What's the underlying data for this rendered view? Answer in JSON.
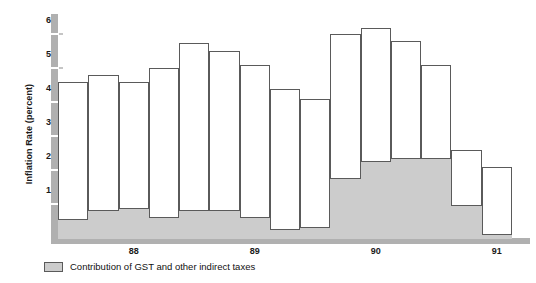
{
  "chart_data": {
    "type": "bar",
    "title": "",
    "subtitle": "",
    "xlabel": "",
    "ylabel": "Inflation Rate (percent)",
    "ylim": [
      0,
      6.6
    ],
    "yticks": [
      1,
      2,
      3,
      4,
      5,
      6
    ],
    "ytick_labels": [
      "1",
      "2",
      "3",
      "4",
      "5",
      "6"
    ],
    "grid": false,
    "legend_position": "bottom-left",
    "stacked": true,
    "x_axis_labels": [
      "88",
      "89",
      "90",
      "91",
      "92"
    ],
    "x_axis_label_positions": [
      2.5,
      6.5,
      10.5,
      14.5,
      17.2
    ],
    "categories": [
      "87Q4",
      "88Q1",
      "88Q2",
      "88Q3",
      "88Q4",
      "89Q1",
      "89Q2",
      "89Q3",
      "89Q4",
      "90Q1",
      "90Q2",
      "90Q3",
      "90Q4",
      "91Q1",
      "91Q2",
      "91Q3",
      "91Q4"
    ],
    "series": [
      {
        "name": "Contribution of GST and other indirect taxes",
        "color": "#cccccc",
        "values": [
          0.6,
          0.85,
          0.9,
          0.65,
          0.85,
          0.85,
          0.65,
          0.3,
          0.35,
          1.8,
          2.3,
          2.4,
          2.4,
          1.0,
          0.15,
          0.0,
          0.0
        ]
      },
      {
        "name": "Other inflation",
        "color": "#ffffff",
        "values": [
          4.0,
          3.95,
          3.7,
          4.35,
          4.9,
          4.65,
          4.45,
          4.1,
          3.75,
          4.2,
          3.9,
          3.4,
          2.7,
          1.6,
          1.95,
          0.0,
          0.0
        ]
      }
    ],
    "totals": [
      4.6,
      4.8,
      4.6,
      5.0,
      5.75,
      5.5,
      5.1,
      4.4,
      4.1,
      6.0,
      6.2,
      5.8,
      5.1,
      2.6,
      2.1,
      0.0,
      0.0
    ],
    "bar_count": 15,
    "bars": [
      {
        "label": "87Q4",
        "total": 4.6,
        "gst": 0.6,
        "x": 0,
        "w": 1
      },
      {
        "label": "88Q1",
        "total": 4.8,
        "gst": 0.85,
        "x": 1,
        "w": 1
      },
      {
        "label": "88Q2",
        "total": 4.6,
        "gst": 0.9,
        "x": 2,
        "w": 1
      },
      {
        "label": "88Q3",
        "total": 5.0,
        "gst": 0.65,
        "x": 3,
        "w": 1
      },
      {
        "label": "88Q4",
        "total": 5.75,
        "gst": 0.85,
        "x": 4,
        "w": 1
      },
      {
        "label": "89Q1",
        "total": 5.5,
        "gst": 0.85,
        "x": 5,
        "w": 1
      },
      {
        "label": "89Q2",
        "total": 5.1,
        "gst": 0.65,
        "x": 6,
        "w": 1
      },
      {
        "label": "89Q3",
        "total": 4.4,
        "gst": 0.3,
        "x": 7,
        "w": 1
      },
      {
        "label": "89Q4",
        "total": 4.1,
        "gst": 0.35,
        "x": 8,
        "w": 1
      },
      {
        "label": "90Q1",
        "total": 6.0,
        "gst": 1.8,
        "x": 9,
        "w": 1
      },
      {
        "label": "90Q2",
        "total": 6.2,
        "gst": 2.3,
        "x": 10,
        "w": 1
      },
      {
        "label": "90Q3",
        "total": 5.8,
        "gst": 2.4,
        "x": 11,
        "w": 1
      },
      {
        "label": "90Q4",
        "total": 5.1,
        "gst": 2.4,
        "x": 12,
        "w": 1
      },
      {
        "label": "91Q1",
        "total": 2.6,
        "gst": 1.0,
        "x": 13,
        "w": 1
      },
      {
        "label": "91Q2",
        "total": 2.1,
        "gst": 0.15,
        "x": 14,
        "w": 1
      }
    ]
  },
  "legend": {
    "swatch_color": "#cccccc",
    "label": "Contribution of GST and other indirect taxes"
  },
  "axis": {
    "y_title": "Inflation Rate (percent)",
    "y_tick_labels": [
      "6",
      "5",
      "4",
      "3",
      "2",
      "1"
    ],
    "x_tick_labels": [
      "88",
      "89",
      "90",
      "91",
      "92"
    ]
  },
  "colors": {
    "gst_fill": "#cccccc",
    "bar_fill": "#ffffff",
    "bar_stroke": "#5a5a5a",
    "axis_gray": "#b0b0b0",
    "text": "#1a1a1a"
  }
}
